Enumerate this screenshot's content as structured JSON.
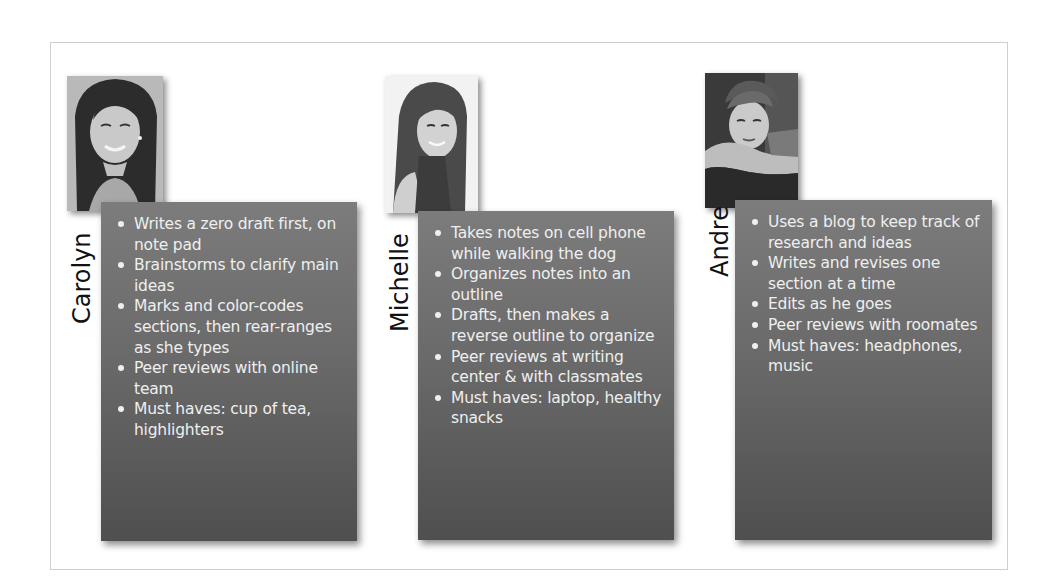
{
  "profiles": [
    {
      "name": "Carolyn",
      "photo_icon": "woman-portrait-photo",
      "habits": [
        "Writes a zero draft first, on note pad",
        "Brainstorms to clarify main ideas",
        "Marks and color-codes sections, then rear-ranges as she types",
        "Peer reviews with online team",
        "Must haves: cup of tea, highlighters"
      ]
    },
    {
      "name": "Michelle",
      "photo_icon": "girl-portrait-photo",
      "habits": [
        "Takes notes on cell phone while walking the dog",
        "Organizes notes into an outline",
        "Drafts, then makes a reverse outline to organize",
        "Peer reviews at writing center & with classmates",
        "Must haves: laptop, healthy snacks"
      ]
    },
    {
      "name": "Andre",
      "photo_icon": "boy-portrait-photo",
      "habits": [
        "Uses a blog to keep track of research and ideas",
        "Writes and revises one section at a time",
        "Edits as he goes",
        "Peer reviews with roomates",
        "Must haves: headphones, music"
      ]
    }
  ],
  "colors": {
    "card_top": "#7c7c7c",
    "card_bottom": "#4f4f4f",
    "card_text": "#efefef",
    "name_text": "#111111",
    "frame_border": "#cfcfcf"
  }
}
